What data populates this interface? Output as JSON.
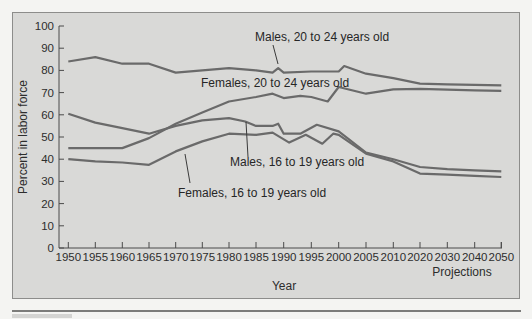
{
  "chart_data": {
    "type": "line",
    "title": "",
    "xlabel": "Year",
    "xlabel_note": "Projections",
    "ylabel": "Percent in labor force",
    "ylim": [
      0,
      100
    ],
    "yticks": [
      0,
      10,
      20,
      30,
      40,
      50,
      60,
      70,
      80,
      90,
      100
    ],
    "xticks": [
      "1950",
      "1955",
      "1960",
      "1965",
      "1970",
      "1975",
      "1980",
      "1985",
      "1990",
      "1995",
      "2000",
      "2005",
      "2010",
      "2020",
      "2030",
      "2040",
      "2050"
    ],
    "grid": false,
    "legend_position": "inline labels",
    "line_color": "#6a6a6a",
    "series": [
      {
        "name": "Males, 20 to 24 years old",
        "x": [
          1950,
          1955,
          1960,
          1965,
          1970,
          1975,
          1980,
          1985,
          1988,
          1989,
          1990,
          1995,
          2000,
          2001,
          2005,
          2010,
          2020,
          2030,
          2040,
          2050
        ],
        "values": [
          84,
          86,
          83,
          83,
          79,
          80,
          81,
          80,
          79,
          81,
          79,
          79.5,
          79.5,
          82,
          78.5,
          76.5,
          74,
          73.7,
          73.5,
          73.3
        ]
      },
      {
        "name": "Females, 20 to 24 years old",
        "x": [
          1950,
          1955,
          1960,
          1965,
          1970,
          1975,
          1980,
          1985,
          1988,
          1990,
          1993,
          1995,
          1998,
          2000,
          2005,
          2010,
          2020,
          2030,
          2040,
          2050
        ],
        "values": [
          45,
          45,
          45,
          49.5,
          56,
          61,
          66,
          68,
          69.5,
          67.5,
          68.5,
          68,
          66,
          72.5,
          69.5,
          71.5,
          71.7,
          71.3,
          71,
          70.8
        ]
      },
      {
        "name": "Males, 16 to 19 years old",
        "x": [
          1950,
          1955,
          1960,
          1965,
          1970,
          1975,
          1980,
          1983,
          1985,
          1988,
          1989,
          1990,
          1993,
          1996,
          2000,
          2005,
          2010,
          2020,
          2030,
          2040,
          2050
        ],
        "values": [
          60.5,
          56.5,
          54,
          51.5,
          55,
          57.5,
          58.5,
          57,
          55,
          55,
          56,
          51.5,
          51.5,
          55.5,
          52.5,
          43,
          40,
          36.5,
          35.5,
          35,
          34.5
        ]
      },
      {
        "name": "Females, 16 to 19 years old",
        "x": [
          1950,
          1955,
          1960,
          1965,
          1970,
          1975,
          1980,
          1985,
          1988,
          1991,
          1994,
          1997,
          1999,
          2000,
          2005,
          2010,
          2020,
          2030,
          2040,
          2050
        ],
        "values": [
          40,
          39,
          38.5,
          37.5,
          43.5,
          48,
          51.5,
          51,
          52,
          47.5,
          51,
          47,
          51.5,
          51,
          42.5,
          39,
          33.5,
          33,
          32.5,
          32
        ]
      }
    ],
    "annotations": [
      {
        "text": "Males, 20 to 24 years old",
        "x": 255,
        "y": 41,
        "leader": [
          [
            273,
            45
          ],
          [
            278,
            64
          ]
        ]
      },
      {
        "text": "Females, 20 to 24 years old",
        "x": 201,
        "y": 87,
        "leader": null
      },
      {
        "text": "Males, 16 to 19 years old",
        "x": 230,
        "y": 166,
        "leader": [
          [
            248,
            157
          ],
          [
            246,
            122
          ]
        ]
      },
      {
        "text": "Females, 16 to 19 years old",
        "x": 178,
        "y": 197,
        "leader": [
          [
            190,
            183
          ],
          [
            185,
            154
          ]
        ]
      }
    ]
  }
}
